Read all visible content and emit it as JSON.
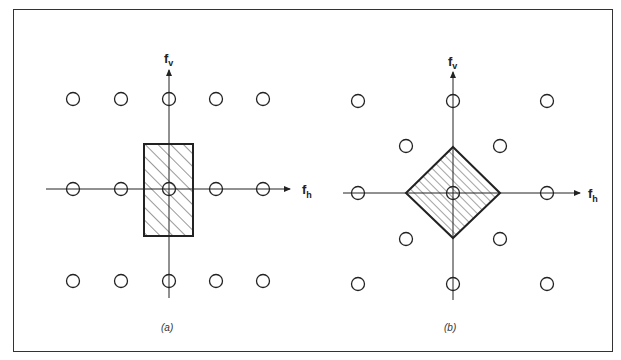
{
  "figure": {
    "panels": [
      {
        "id": "a",
        "caption": "(a)",
        "axis_h_label": "f",
        "axis_h_sub": "h",
        "axis_v_label": "f",
        "axis_v_sub": "v",
        "lattice": "rectangular",
        "passband_shape": "rectangle",
        "origin": [
          169,
          189
        ],
        "circles": [
          [
            73,
            99
          ],
          [
            121,
            99
          ],
          [
            169,
            99
          ],
          [
            216,
            99
          ],
          [
            263,
            99
          ],
          [
            73,
            189
          ],
          [
            121,
            189
          ],
          [
            169,
            189
          ],
          [
            216,
            189
          ],
          [
            263,
            189
          ],
          [
            73,
            281
          ],
          [
            121,
            281
          ],
          [
            169,
            281
          ],
          [
            216,
            281
          ],
          [
            263,
            281
          ]
        ],
        "passband": {
          "x": 144,
          "y": 144,
          "w": 49,
          "h": 92
        }
      },
      {
        "id": "b",
        "caption": "(b)",
        "axis_h_label": "f",
        "axis_h_sub": "h",
        "axis_v_label": "f",
        "axis_v_sub": "v",
        "lattice": "quincunx",
        "passband_shape": "diamond",
        "origin": [
          453,
          193
        ],
        "circles": [
          [
            358,
            101
          ],
          [
            453,
            101
          ],
          [
            547,
            101
          ],
          [
            406,
            146
          ],
          [
            500,
            146
          ],
          [
            358,
            193
          ],
          [
            453,
            193
          ],
          [
            547,
            193
          ],
          [
            406,
            239
          ],
          [
            500,
            239
          ],
          [
            358,
            284
          ],
          [
            453,
            284
          ],
          [
            547,
            284
          ]
        ],
        "passband": {
          "points": [
            [
              453,
              147
            ],
            [
              500,
              193
            ],
            [
              453,
              238
            ],
            [
              406,
              193
            ]
          ]
        }
      }
    ],
    "colors": {
      "line": "#222222",
      "hatch": "#333333",
      "frame": "#333333"
    }
  }
}
